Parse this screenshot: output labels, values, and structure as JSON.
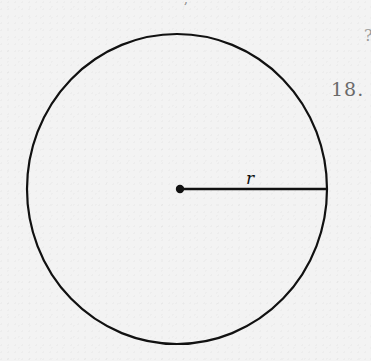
{
  "figure": {
    "type": "circle",
    "radius_label": "r",
    "center": {
      "x": 180,
      "y": 189
    },
    "ellipse": {
      "cx": 177,
      "cy": 189,
      "rx": 150,
      "ry": 155
    },
    "radius_line": {
      "x1": 180,
      "y1": 189,
      "x2": 326,
      "y2": 189
    },
    "stroke_color": "#111111"
  },
  "margin": {
    "problem_number": "18.",
    "partial_glyph": "?",
    "top_fragment": ","
  }
}
